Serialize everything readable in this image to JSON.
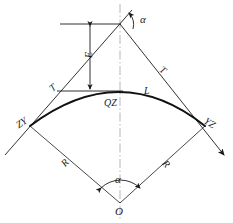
{
  "diagram": {
    "type": "geometric-construction",
    "colors": {
      "line": "#1a1a1a",
      "curve": "#111111",
      "axis": "#9a9a9a",
      "background": "#ffffff"
    },
    "labels": {
      "alpha_top": "α",
      "alpha_bottom": "α",
      "external_distance": "E",
      "tangent_left": "T",
      "tangent_right": "T",
      "curve_length": "L",
      "mid_point": "QZ",
      "begin_curve": "ZY",
      "end_curve": "YZ",
      "radius_left": "R",
      "radius_right": "R",
      "center": "O"
    },
    "points": {
      "JD": {
        "x": 120,
        "y": 24,
        "name": "intersection-point"
      },
      "ZY": {
        "x": 30,
        "y": 126,
        "name": "curve-start-point"
      },
      "YZ": {
        "x": 205,
        "y": 126,
        "name": "curve-end-point"
      },
      "QZ": {
        "x": 120,
        "y": 94,
        "name": "curve-midpoint"
      },
      "O": {
        "x": 120,
        "y": 203,
        "name": "circle-center"
      }
    },
    "geometry": {
      "radius_px": 107,
      "deflection_angle_deg": 78,
      "curve_sagitta_px": 32
    }
  }
}
